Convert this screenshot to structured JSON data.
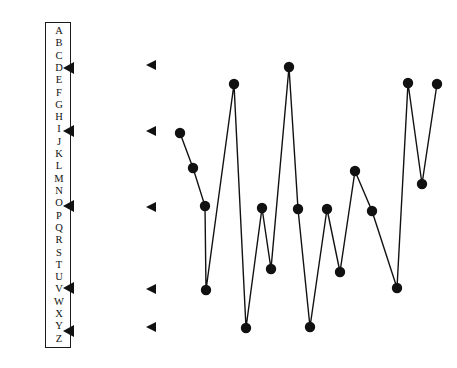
{
  "page": {
    "background_color": "#ffffff",
    "ink_color": "#111111",
    "width": 457,
    "height": 368
  },
  "alphabet_index": {
    "name": "alphabet-index-panel",
    "border_color": "#1a1a1a",
    "letters": [
      "A",
      "B",
      "C",
      "D",
      "E",
      "F",
      "G",
      "H",
      "I",
      "J",
      "K",
      "L",
      "M",
      "N",
      "O",
      "P",
      "Q",
      "R",
      "S",
      "T",
      "U",
      "V",
      "W",
      "X",
      "Y",
      "Z"
    ],
    "marked_letters": [
      "D",
      "I",
      "O",
      "U",
      "Y"
    ],
    "markers": [
      {
        "label": "D",
        "letter_index": 3,
        "x": 63,
        "y": 68
      },
      {
        "label": "I",
        "letter_index": 8,
        "x": 63,
        "y": 131
      },
      {
        "label": "O",
        "letter_index": 14,
        "x": 63,
        "y": 206
      },
      {
        "label": "U",
        "letter_index": 20,
        "x": 63,
        "y": 288
      },
      {
        "label": "Y",
        "letter_index": 24,
        "x": 63,
        "y": 331
      }
    ]
  },
  "gutter_markers": {
    "name": "gutter-arrow-column",
    "items": [
      {
        "x": 146,
        "y": 65
      },
      {
        "x": 146,
        "y": 131
      },
      {
        "x": 146,
        "y": 207
      },
      {
        "x": 146,
        "y": 289
      },
      {
        "x": 146,
        "y": 327
      }
    ]
  },
  "chart_data": {
    "type": "line",
    "title": "",
    "subtitle": "",
    "xlabel": "",
    "ylabel": "",
    "grid": false,
    "legend": null,
    "markers": "filled-circle",
    "marker_radius": 5.2,
    "line_color": "#111111",
    "marker_color": "#111111",
    "xlim": [
      0,
      20
    ],
    "ylim": [
      0,
      10
    ],
    "x": [
      0,
      1,
      2,
      3,
      4,
      5,
      6,
      7,
      8,
      9,
      10,
      11,
      12,
      13,
      14,
      15,
      16,
      17,
      18,
      19,
      20
    ],
    "values": [
      7.8,
      6.5,
      5.2,
      1.9,
      9.5,
      0.5,
      5.1,
      2.8,
      9.9,
      5.1,
      0.6,
      5.1,
      2.9,
      6.4,
      4.9,
      2.0,
      9.6,
      5.8,
      9.5,
      0,
      0
    ],
    "points_px": [
      {
        "x": 180,
        "y": 133
      },
      {
        "x": 193,
        "y": 168
      },
      {
        "x": 205,
        "y": 206
      },
      {
        "x": 206,
        "y": 290
      },
      {
        "x": 234,
        "y": 84
      },
      {
        "x": 246,
        "y": 328
      },
      {
        "x": 262,
        "y": 208
      },
      {
        "x": 271,
        "y": 269
      },
      {
        "x": 289,
        "y": 67
      },
      {
        "x": 298,
        "y": 209
      },
      {
        "x": 310,
        "y": 327
      },
      {
        "x": 327,
        "y": 209
      },
      {
        "x": 340,
        "y": 272
      },
      {
        "x": 355,
        "y": 171
      },
      {
        "x": 372,
        "y": 211
      },
      {
        "x": 397,
        "y": 288
      },
      {
        "x": 408,
        "y": 83
      },
      {
        "x": 422,
        "y": 184
      },
      {
        "x": 437,
        "y": 84
      }
    ]
  }
}
